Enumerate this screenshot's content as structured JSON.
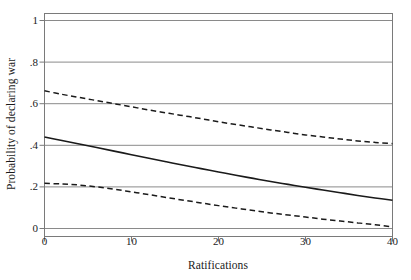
{
  "chart_data": {
    "type": "line",
    "title": "",
    "xlabel": "Ratifications",
    "ylabel": "Probability of declaring war",
    "xlim": [
      0,
      40
    ],
    "ylim": [
      0,
      1
    ],
    "grid": true,
    "legend": "none",
    "xticks": [
      {
        "value": 0,
        "label": "0"
      },
      {
        "value": 10,
        "label": "10"
      },
      {
        "value": 20,
        "label": "20"
      },
      {
        "value": 30,
        "label": "30"
      },
      {
        "value": 40,
        "label": "40"
      }
    ],
    "yticks": [
      {
        "value": 0,
        "label": "0"
      },
      {
        "value": 0.2,
        "label": ".2"
      },
      {
        "value": 0.4,
        "label": ".4"
      },
      {
        "value": 0.6,
        "label": ".6"
      },
      {
        "value": 0.8,
        "label": ".8"
      },
      {
        "value": 1,
        "label": "1"
      }
    ],
    "x": [
      0,
      2,
      4,
      6,
      8,
      10,
      12,
      14,
      16,
      18,
      20,
      22,
      24,
      26,
      28,
      30,
      32,
      34,
      36,
      38,
      40
    ],
    "series": [
      {
        "name": "Upper 95% confidence bound",
        "style": "dashed",
        "color": "#1a1a1a",
        "values": [
          0.662,
          0.645,
          0.63,
          0.615,
          0.6,
          0.585,
          0.57,
          0.556,
          0.542,
          0.528,
          0.513,
          0.5,
          0.487,
          0.474,
          0.462,
          0.45,
          0.44,
          0.43,
          0.421,
          0.414,
          0.408
        ]
      },
      {
        "name": "Predicted probability",
        "style": "solid",
        "color": "#1a1a1a",
        "values": [
          0.44,
          0.423,
          0.406,
          0.389,
          0.372,
          0.355,
          0.338,
          0.321,
          0.304,
          0.288,
          0.272,
          0.256,
          0.241,
          0.226,
          0.212,
          0.198,
          0.185,
          0.172,
          0.159,
          0.147,
          0.136
        ]
      },
      {
        "name": "Lower 95% confidence bound",
        "style": "dashed",
        "color": "#1a1a1a",
        "values": [
          0.217,
          0.214,
          0.209,
          0.2,
          0.189,
          0.176,
          0.163,
          0.149,
          0.136,
          0.123,
          0.11,
          0.098,
          0.086,
          0.075,
          0.065,
          0.055,
          0.045,
          0.036,
          0.027,
          0.018,
          0.008
        ]
      }
    ]
  },
  "axes": {
    "frame_color": "#7a7a7a",
    "grid_color": "#8a8a8a",
    "line_color": "#1a1a1a"
  }
}
